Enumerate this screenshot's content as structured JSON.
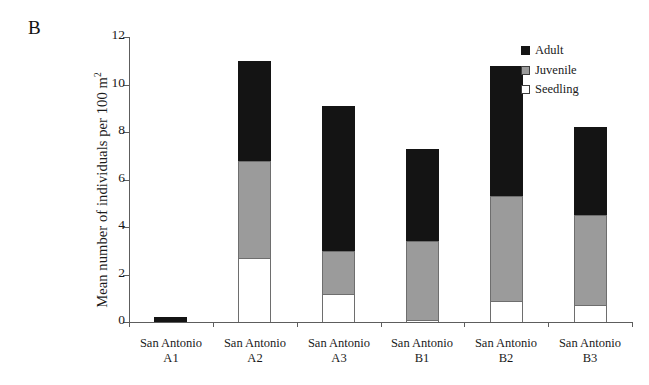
{
  "figure": {
    "panel_label": "B"
  },
  "chart_data": {
    "type": "bar",
    "subtype": "stacked-vertical",
    "title": "",
    "panel_label": "B",
    "xlabel": "",
    "ylabel": "Mean number of individuals per 100 m",
    "ylabel_superscript": "2",
    "ylim": [
      0,
      12
    ],
    "yticks": [
      0,
      2,
      4,
      6,
      8,
      10,
      12
    ],
    "ytick_labels": [
      "0",
      "2",
      "4",
      "6",
      "8",
      "10",
      "12"
    ],
    "grid": false,
    "legend_position": "top-right",
    "categories": [
      "San Antonio A1",
      "San Antonio A2",
      "San Antonio A3",
      "San Antonio B1",
      "San Antonio B2",
      "San Antonio B3"
    ],
    "category_lines": [
      {
        "line1": "San Antonio",
        "line2": "A1"
      },
      {
        "line1": "San Antonio",
        "line2": "A2"
      },
      {
        "line1": "San Antonio",
        "line2": "A3"
      },
      {
        "line1": "San Antonio",
        "line2": "B1"
      },
      {
        "line1": "San Antonio",
        "line2": "B2"
      },
      {
        "line1": "San Antonio",
        "line2": "B3"
      }
    ],
    "series": [
      {
        "name": "Seedling",
        "color": "#ffffff",
        "stack_order": 0,
        "values": [
          0.0,
          2.7,
          1.2,
          0.1,
          0.9,
          0.7
        ]
      },
      {
        "name": "Juvenile",
        "color": "#9b9b9b",
        "stack_order": 1,
        "values": [
          0.0,
          4.1,
          1.8,
          3.3,
          4.4,
          3.8
        ]
      },
      {
        "name": "Adult",
        "color": "#141414",
        "stack_order": 2,
        "values": [
          0.2,
          4.2,
          6.1,
          3.9,
          5.5,
          3.7
        ]
      }
    ],
    "totals": [
      0.2,
      11.0,
      9.1,
      7.3,
      10.8,
      8.2
    ],
    "legend": [
      {
        "label": "Adult",
        "color": "#141414"
      },
      {
        "label": "Juvenile",
        "color": "#9b9b9b"
      },
      {
        "label": "Seedling",
        "color": "#ffffff"
      }
    ]
  }
}
